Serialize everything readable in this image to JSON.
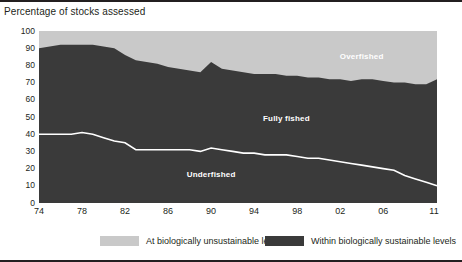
{
  "chart_data": {
    "type": "area",
    "title": "Percentage of stocks assessed",
    "subtitle": "",
    "xlabel": "",
    "ylabel": "",
    "stacked": true,
    "grid": false,
    "legend_position": "bottom",
    "ylim": [
      0,
      100
    ],
    "yticks": [
      0,
      10,
      20,
      30,
      40,
      50,
      60,
      70,
      80,
      90,
      100
    ],
    "ytick_labels": [
      "0",
      "10",
      "20",
      "30",
      "40",
      "50",
      "60",
      "70",
      "80",
      "90",
      "100"
    ],
    "xlim": [
      1974,
      2011
    ],
    "xticks": [
      1974,
      1978,
      1982,
      1986,
      1990,
      1994,
      1998,
      2002,
      2006,
      2011
    ],
    "xtick_labels": [
      "74",
      "78",
      "82",
      "86",
      "90",
      "94",
      "98",
      "02",
      "06",
      "11"
    ],
    "x": [
      1974,
      1975,
      1976,
      1977,
      1978,
      1979,
      1980,
      1981,
      1982,
      1983,
      1984,
      1985,
      1986,
      1987,
      1988,
      1989,
      1990,
      1991,
      1992,
      1993,
      1994,
      1995,
      1996,
      1997,
      1998,
      1999,
      2000,
      2001,
      2002,
      2003,
      2004,
      2005,
      2006,
      2007,
      2008,
      2009,
      2010,
      2011
    ],
    "series": [
      {
        "name": "Underfished",
        "label": "Underfished",
        "color": "#3a3a3a",
        "values": [
          40,
          40,
          40,
          40,
          41,
          40,
          38,
          36,
          35,
          31,
          31,
          31,
          31,
          31,
          31,
          30,
          32,
          31,
          30,
          29,
          29,
          28,
          28,
          28,
          27,
          26,
          26,
          25,
          24,
          23,
          22,
          21,
          20,
          19,
          16,
          14,
          12,
          10
        ]
      },
      {
        "name": "Fully fished",
        "label": "Fully fished",
        "color": "#3a3a3a",
        "values": [
          50,
          51,
          52,
          52,
          51,
          52,
          53,
          54,
          51,
          52,
          51,
          50,
          48,
          47,
          46,
          46,
          50,
          47,
          47,
          47,
          46,
          47,
          47,
          46,
          47,
          47,
          47,
          47,
          48,
          48,
          50,
          51,
          51,
          51,
          54,
          55,
          57,
          62
        ]
      },
      {
        "name": "Overfished",
        "label": "Overfished",
        "color": "#c9c9c9",
        "values": [
          10,
          9,
          8,
          8,
          8,
          8,
          9,
          10,
          14,
          17,
          18,
          19,
          21,
          22,
          23,
          24,
          18,
          22,
          23,
          24,
          25,
          25,
          25,
          26,
          26,
          27,
          27,
          28,
          28,
          29,
          28,
          28,
          29,
          30,
          30,
          31,
          31,
          28
        ]
      }
    ],
    "boundaries": {
      "underfished_top": [
        40,
        40,
        40,
        40,
        41,
        40,
        38,
        36,
        35,
        31,
        31,
        31,
        31,
        31,
        31,
        30,
        32,
        31,
        30,
        29,
        29,
        28,
        28,
        28,
        27,
        26,
        26,
        25,
        24,
        23,
        22,
        21,
        20,
        19,
        16,
        14,
        12,
        10
      ],
      "sustainable_top": [
        90,
        91,
        92,
        92,
        92,
        92,
        91,
        90,
        86,
        83,
        82,
        81,
        79,
        78,
        77,
        76,
        82,
        78,
        77,
        76,
        75,
        75,
        75,
        74,
        74,
        73,
        73,
        72,
        72,
        71,
        72,
        72,
        71,
        70,
        70,
        69,
        69,
        72
      ]
    },
    "legend": [
      {
        "label": "At biologically unsustainable levels",
        "color": "#c9c9c9"
      },
      {
        "label": "Within biologically sustainable levels",
        "color": "#3a3a3a"
      }
    ],
    "annotations": [
      {
        "text": "Overfished",
        "x": 2004,
        "y": 85,
        "color": "#ffffff"
      },
      {
        "text": "Fully fished",
        "x": 1997,
        "y": 49,
        "color": "#ffffff"
      },
      {
        "text": "Underfished",
        "x": 1990,
        "y": 16,
        "color": "#ffffff"
      }
    ]
  },
  "colors": {
    "unsustainable": "#c9c9c9",
    "sustainable": "#3a3a3a",
    "divider_line": "#ffffff",
    "text": "#231f20",
    "rule": "#231f20"
  }
}
